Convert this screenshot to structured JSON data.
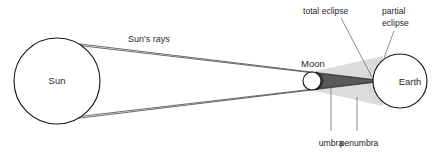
{
  "diagram": {
    "background_color": "#ffffff"
  },
  "bodies": {
    "sun": {
      "label": "Sun",
      "cx": 57,
      "cy": 81,
      "r": 43,
      "fill": "#ffffff",
      "stroke": "#1a1a1a"
    },
    "moon": {
      "label": "Moon",
      "cx": 313,
      "cy": 81,
      "r": 9,
      "fill": "#ffffff",
      "stroke": "#1a1a1a"
    },
    "earth": {
      "label": "Earth",
      "cx": 400,
      "cy": 81,
      "r": 27,
      "fill": "#ffffff",
      "stroke": "#1a1a1a"
    }
  },
  "shadows": {
    "umbra": {
      "label": "umbra",
      "color": "#565656",
      "leader_x": 331,
      "leader_y_top": 88,
      "leader_y_bottom": 131,
      "label_x": 317,
      "label_y": 143
    },
    "penumbra": {
      "label": "penumbra",
      "color": "#d9d9d9",
      "leader_x": 357,
      "leader_y_top": 96,
      "leader_y_bottom": 131,
      "label_x": 345,
      "label_y": 143
    },
    "earth_shaded_region": {
      "color": "#d2d2d2"
    }
  },
  "annotations": {
    "sun_rays": {
      "label": "Sun's rays",
      "x": 128,
      "y": 42
    },
    "total_eclipse": {
      "label": "total eclipse",
      "x": 303,
      "y": 12,
      "leader_from_x": 340,
      "leader_from_y": 17,
      "leader_to_x": 372,
      "leader_to_y": 79
    },
    "partial_eclipse": {
      "line1": "partial",
      "line2": "eclipse",
      "x": 382,
      "y1": 12,
      "y2": 25,
      "leader_from_x": 394,
      "leader_from_y": 30,
      "leader_to_x": 385,
      "leader_to_y": 59
    }
  },
  "rays": {
    "stroke_color": "#3a3a3a",
    "lines": [
      {
        "name": "top-outer",
        "x1": 72,
        "y1": 43,
        "x2": 427,
        "y2": 85
      },
      {
        "name": "top-inner",
        "x1": 74,
        "y1": 44,
        "x2": 375,
        "y2": 81
      },
      {
        "name": "bottom-outer",
        "x1": 72,
        "y1": 119,
        "x2": 427,
        "y2": 77
      },
      {
        "name": "bottom-inner",
        "x1": 74,
        "y1": 118,
        "x2": 375,
        "y2": 81
      }
    ]
  }
}
